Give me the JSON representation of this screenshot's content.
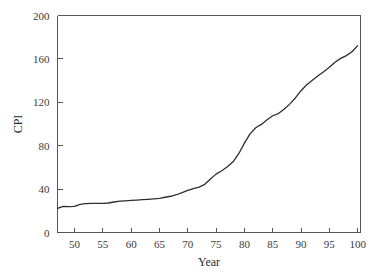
{
  "chart_data": {
    "type": "line",
    "title": "",
    "xlabel": "Year",
    "ylabel": "CPI",
    "xlim": [
      47,
      100.5
    ],
    "ylim": [
      0,
      200
    ],
    "grid": false,
    "legend": null,
    "x_ticks": [
      50,
      55,
      60,
      65,
      70,
      75,
      80,
      85,
      90,
      95,
      100
    ],
    "y_ticks": [
      0,
      40,
      80,
      120,
      160,
      200
    ],
    "x_tick_labels": [
      "50",
      "55",
      "60",
      "65",
      "70",
      "75",
      "80",
      "85",
      "90",
      "95",
      "100"
    ],
    "y_tick_labels": [
      "0",
      "40",
      "80",
      "120",
      "160",
      "200"
    ],
    "line_color": "#2e2e2e",
    "frame_color": "#555555",
    "series": [
      {
        "name": "CPI",
        "x": [
          47,
          48,
          49,
          50,
          51,
          52,
          53,
          54,
          55,
          56,
          57,
          58,
          59,
          60,
          61,
          62,
          63,
          64,
          65,
          66,
          67,
          68,
          69,
          70,
          71,
          72,
          73,
          74,
          75,
          76,
          77,
          78,
          79,
          80,
          81,
          82,
          83,
          84,
          85,
          86,
          87,
          88,
          89,
          90,
          91,
          92,
          93,
          94,
          95,
          96,
          97,
          98,
          99,
          100
        ],
        "values": [
          22.3,
          24.1,
          23.8,
          24.1,
          26.0,
          26.6,
          26.8,
          26.9,
          26.8,
          27.2,
          28.1,
          28.9,
          29.2,
          29.6,
          29.9,
          30.3,
          30.6,
          31.0,
          31.5,
          32.5,
          33.4,
          34.8,
          36.7,
          38.8,
          40.5,
          41.8,
          44.4,
          49.3,
          53.8,
          56.9,
          60.6,
          65.2,
          72.6,
          82.4,
          90.9,
          96.5,
          99.6,
          103.9,
          107.6,
          109.6,
          113.6,
          118.3,
          124.0,
          130.7,
          136.2,
          140.3,
          144.5,
          148.2,
          152.4,
          156.9,
          160.5,
          163.0,
          166.6,
          172.2
        ]
      }
    ]
  },
  "axis": {
    "y_label": "CPI",
    "x_label": "Year"
  }
}
